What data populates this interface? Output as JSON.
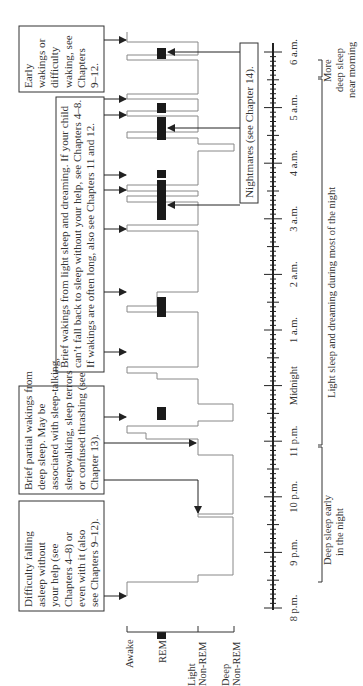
{
  "orientation": "rotated-90-ccw",
  "stages": {
    "awake": "Awake",
    "rem": "REM",
    "light": [
      "Light",
      "Non-REM"
    ],
    "deep": [
      "Deep",
      "Non-REM"
    ]
  },
  "time_axis": {
    "labels": [
      "8 p.m.",
      "9 p.m.",
      "10 p.m.",
      "11 p.m.",
      "Midnight",
      "1 a.m.",
      "2 a.m.",
      "3 a.m.",
      "4 a.m.",
      "5 a.m.",
      "6 a.m."
    ]
  },
  "notes": {
    "falling_asleep": [
      "Difficulty falling",
      "asleep without",
      "your help (see",
      "Chapters 4–8) or",
      "even with it (also",
      "see Chapters 9–12)."
    ],
    "partial_wakings": [
      "Brief partial wakings from",
      "deep sleep. May be",
      "associated with sleep-talking,",
      "sleepwalking, sleep terrors",
      "or confused thrashing (see",
      "Chapter 13)."
    ],
    "brief_wakings": [
      "Brief wakings from light sleep and dreaming. If your child",
      "can’t fall back to sleep without your help, see Chapters 4–8.",
      "If wakings are often long, also see Chapters 11 and 12."
    ],
    "early_wakings": [
      "Early",
      "wakings or",
      "difficulty",
      "waking, see",
      "Chapters",
      "9–12."
    ],
    "nightmares": "Nightmares (see Chapter 14)."
  },
  "brackets": {
    "deep_early": [
      "Deep sleep early",
      "in the night"
    ],
    "light_most": "Light sleep and dreaming during most of the night",
    "deep_morning": [
      "More",
      "deep sleep",
      "near morning"
    ]
  },
  "colors": {
    "line": "#888888",
    "ink": "#222222",
    "rem": "#1a1a1a"
  }
}
